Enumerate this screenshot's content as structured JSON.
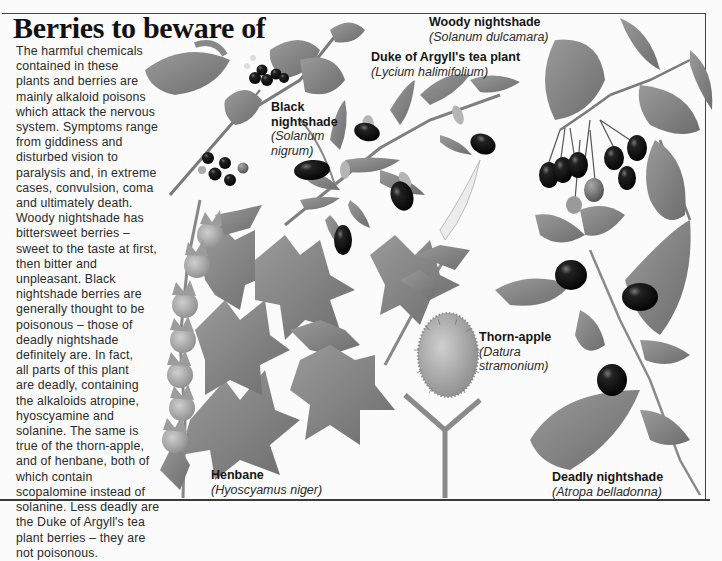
{
  "page": {
    "title": "Berries to beware of",
    "body_lines": [
      "The harmful chemicals",
      "contained in these",
      "plants and berries are",
      "mainly alkaloid poisons",
      "which attack the nervous",
      "system. Symptoms range",
      "from giddiness and",
      "disturbed vision to",
      "paralysis and, in extreme",
      "cases, convulsion, coma",
      "and ultimately death.",
      "Woody nightshade has",
      "bittersweet berries –",
      "sweet to the taste at first,",
      "then bitter and",
      "unpleasant. Black",
      "nightshade berries are",
      "generally thought to be",
      "poisonous – those of",
      "deadly nightshade",
      "definitely are. In fact,",
      "all parts of this plant",
      "are deadly, containing",
      "the alkaloids atropine,",
      "hyoscyamine and",
      "solanine. The same is",
      "true of the thorn-apple,",
      "and of henbane, both of",
      "which contain",
      "scopalomine instead of",
      "solanine. Less deadly are",
      "the Duke of Argyll's tea",
      "plant berries – they are",
      "not poisonous."
    ]
  },
  "plants": [
    {
      "id": "woody-nightshade",
      "common": "Woody nightshade",
      "latin": "(Solanum dulcamara)"
    },
    {
      "id": "duke-of-argylls-tea-plant",
      "common": "Duke of Argyll's tea plant",
      "latin": "(Lycium halimifolium)"
    },
    {
      "id": "black-nightshade",
      "common_line1": "Black",
      "common_line2": "nightshade",
      "latin_line1": "(Solanum",
      "latin_line2": "nigrum)"
    },
    {
      "id": "thorn-apple",
      "common": "Thorn-apple",
      "latin_line1": "(Datura",
      "latin_line2": "stramonium)"
    },
    {
      "id": "henbane",
      "common": "Henbane",
      "latin": "(Hyoscyamus niger)"
    },
    {
      "id": "deadly-nightshade",
      "common": "Deadly nightshade",
      "latin": "(Atropa belladonna)"
    }
  ],
  "colors": {
    "leaf": "#8a8a8a",
    "leaf_dark": "#6e6e6e",
    "berry": "#141414",
    "stem": "#7a7a7a",
    "paper": "#fbfbfb"
  }
}
